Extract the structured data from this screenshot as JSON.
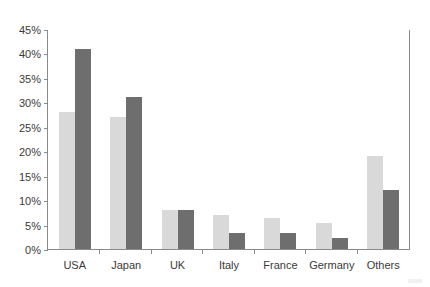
{
  "chart_data": {
    "type": "bar",
    "title": "",
    "subtitle": "",
    "xlabel": "",
    "ylabel": "",
    "categories": [
      "USA",
      "Japan",
      "UK",
      "Italy",
      "France",
      "Germany",
      "Others"
    ],
    "series": [
      {
        "name": "Series 1",
        "color": "#d9d9d9",
        "values": [
          28,
          27,
          8,
          7,
          6.3,
          5.3,
          19
        ]
      },
      {
        "name": "Series 2",
        "color": "#6e6e6e",
        "values": [
          41,
          31,
          8,
          3.3,
          3.3,
          2.3,
          12
        ]
      }
    ],
    "ylim": [
      0,
      45
    ],
    "ytick_step": 5,
    "ytick_labels": [
      "45%",
      "40%",
      "35%",
      "30%",
      "25%",
      "20%",
      "15%",
      "10%",
      "5%",
      "0%"
    ],
    "ytick_values": [
      45,
      40,
      35,
      30,
      25,
      20,
      15,
      10,
      5,
      0
    ],
    "grid": false,
    "legend": "none",
    "value_suffix": "%"
  },
  "colors": {
    "series1": "#d9d9d9",
    "series2": "#6e6e6e",
    "axis": "#8a8a8a",
    "text": "#3a3a3a",
    "background": "#ffffff"
  }
}
